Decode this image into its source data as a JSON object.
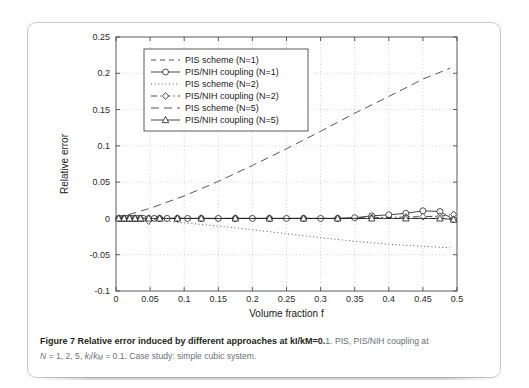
{
  "figure": {
    "caption_bold": "Figure 7 Relative error induced by different approaches at kI/kM=0.",
    "caption_rest": "1. PIS, PIS/NIH coupling at",
    "caption_line2_prefix": "N",
    "caption_line2_mid": " = 1, 2, 5, ",
    "caption_line2_k1": "k",
    "caption_line2_k1sub": "I",
    "caption_line2_slash": "/",
    "caption_line2_k2": "k",
    "caption_line2_k2sub": "M",
    "caption_line2_tail": " = 0.1. Case study: simple cubic system."
  },
  "chart_data": {
    "type": "line",
    "title": "",
    "xlabel": "Volume fraction f",
    "ylabel": "Relative error",
    "xlim": [
      0,
      0.5
    ],
    "ylim": [
      -0.1,
      0.25
    ],
    "xticks": [
      0,
      0.05,
      0.1,
      0.15,
      0.2,
      0.25,
      0.3,
      0.35,
      0.4,
      0.45,
      0.5
    ],
    "xticklabels": [
      "0",
      "0.05",
      "0.1",
      "0.15",
      "0.2",
      "0.25",
      "0.3",
      "0.35",
      "0.4",
      "0.45",
      "0.5"
    ],
    "yticks": [
      -0.1,
      -0.05,
      0,
      0.05,
      0.1,
      0.15,
      0.2,
      0.25
    ],
    "yticklabels": [
      "-0.1",
      "-0.05",
      "0",
      "0.05",
      "0.1",
      "0.15",
      "0.2",
      "0.25"
    ],
    "grid": true,
    "grid_style": "dotted",
    "legend_position": "upper left",
    "series": [
      {
        "name": "PIS scheme (N=1)",
        "style": "dashed",
        "marker": "none",
        "color": "#333333",
        "x": [
          0.0,
          0.025,
          0.05,
          0.075,
          0.1,
          0.125,
          0.15,
          0.175,
          0.2,
          0.225,
          0.25,
          0.275,
          0.3,
          0.325,
          0.35,
          0.375,
          0.4,
          0.425,
          0.45,
          0.475,
          0.49
        ],
        "y": [
          0.0,
          0.0,
          0.0,
          0.0,
          0.0,
          0.0,
          0.0,
          0.0,
          0.0,
          0.0,
          0.0,
          0.0,
          0.0,
          0.0,
          0.0,
          0.0,
          0.0,
          0.0,
          0.0,
          0.0,
          0.0
        ]
      },
      {
        "name": "PIS/NIH coupling (N=1)",
        "style": "solid",
        "marker": "circle",
        "color": "#222222",
        "x": [
          0.004,
          0.008,
          0.012,
          0.016,
          0.02,
          0.024,
          0.028,
          0.032,
          0.036,
          0.04,
          0.048,
          0.056,
          0.064,
          0.075,
          0.09,
          0.105,
          0.125,
          0.15,
          0.175,
          0.2,
          0.225,
          0.25,
          0.275,
          0.3,
          0.325,
          0.35,
          0.375,
          0.4,
          0.425,
          0.45,
          0.475,
          0.495
        ],
        "y": [
          0.0,
          0.0,
          0.0,
          0.0,
          0.0,
          0.0,
          0.0,
          0.0,
          0.0,
          0.0,
          0.0,
          0.0,
          0.0,
          0.0,
          0.0,
          0.0,
          0.0,
          0.0,
          0.0,
          0.0,
          0.0,
          0.0,
          0.0,
          0.0,
          0.0,
          0.001,
          0.0035,
          0.005,
          0.007,
          0.0105,
          0.0095,
          -0.0015
        ]
      },
      {
        "name": "PIS scheme (N=2)",
        "style": "dotted",
        "marker": "none",
        "color": "#3a3a3a",
        "x": [
          0.0,
          0.05,
          0.1,
          0.15,
          0.2,
          0.25,
          0.3,
          0.35,
          0.4,
          0.45,
          0.49
        ],
        "y": [
          0.0,
          -0.0025,
          -0.006,
          -0.0105,
          -0.0155,
          -0.021,
          -0.0265,
          -0.0315,
          -0.0355,
          -0.0385,
          -0.0405
        ]
      },
      {
        "name": "PIS/NIH coupling (N=2)",
        "style": "dashdot",
        "marker": "diamond",
        "color": "#2b2b2b",
        "x": [
          0.004,
          0.012,
          0.02,
          0.028,
          0.036,
          0.048,
          0.064,
          0.09,
          0.125,
          0.175,
          0.225,
          0.275,
          0.325,
          0.375,
          0.425,
          0.45,
          0.475,
          0.495
        ],
        "y": [
          0.0,
          0.0,
          0.0,
          0.0,
          0.0,
          -0.0035,
          0.0,
          0.0,
          0.0,
          0.0,
          0.0,
          0.0,
          0.0,
          0.001,
          0.002,
          0.0025,
          0.003,
          0.0055
        ]
      },
      {
        "name": "PIS scheme (N=5)",
        "style": "longdash",
        "marker": "none",
        "color": "#3a3a3a",
        "x": [
          0.0,
          0.05,
          0.1,
          0.15,
          0.2,
          0.25,
          0.3,
          0.35,
          0.4,
          0.45,
          0.49
        ],
        "y": [
          0.0,
          0.014,
          0.031,
          0.051,
          0.073,
          0.096,
          0.12,
          0.145,
          0.168,
          0.192,
          0.207
        ]
      },
      {
        "name": "PIS/NIH coupling (N=5)",
        "style": "solid",
        "marker": "triangle",
        "color": "#222222",
        "x": [
          0.004,
          0.012,
          0.02,
          0.028,
          0.036,
          0.048,
          0.064,
          0.09,
          0.125,
          0.175,
          0.225,
          0.275,
          0.325,
          0.375,
          0.425,
          0.475,
          0.495
        ],
        "y": [
          0.0,
          0.0,
          0.0,
          0.0,
          0.0,
          0.0,
          0.0,
          0.0,
          0.0,
          0.0,
          0.0,
          0.0,
          0.0,
          0.0,
          0.0,
          0.0,
          -0.0015
        ]
      }
    ]
  }
}
